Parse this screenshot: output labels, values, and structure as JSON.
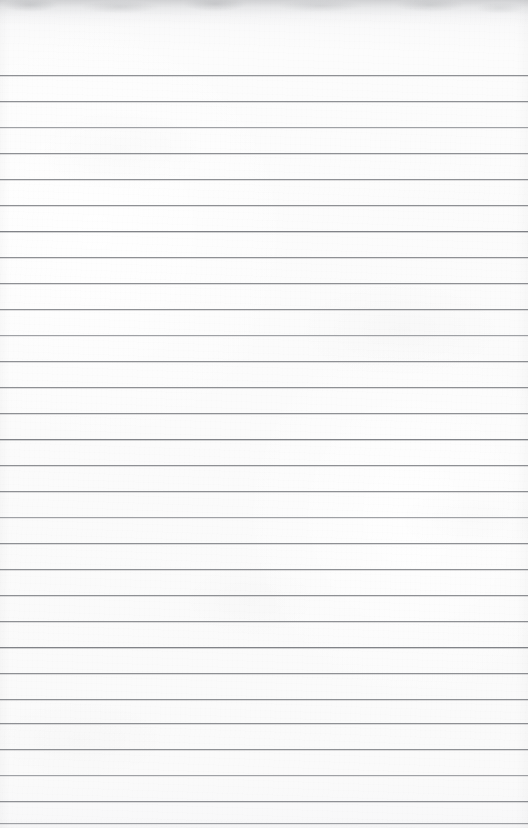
{
  "document": {
    "kind": "scanned-lined-notebook-page",
    "title": "Blank lined notebook page",
    "content_text": "",
    "is_blank": true,
    "page_width_px": 528,
    "page_height_px": 828
  },
  "paper": {
    "background_color": "#fbfbfb",
    "texture": "subtle scan grain",
    "top_edge_smudge_color": "#96989c"
  },
  "ruling": {
    "line_color": "#8e9094",
    "line_color_faint": "#9fa1a5",
    "line_color_strong": "#818388",
    "line_thickness_px": 1,
    "line_spacing_px": 26,
    "first_line_y_px": 75,
    "line_count": 29,
    "left_margin_px": 0,
    "right_margin_px": 0,
    "has_vertical_margin_rule": false,
    "lines": [
      {
        "index": 1,
        "y": 75,
        "weight": "normal"
      },
      {
        "index": 2,
        "y": 101,
        "weight": "normal"
      },
      {
        "index": 3,
        "y": 127,
        "weight": "faint"
      },
      {
        "index": 4,
        "y": 153,
        "weight": "normal"
      },
      {
        "index": 5,
        "y": 179,
        "weight": "normal"
      },
      {
        "index": 6,
        "y": 205,
        "weight": "normal"
      },
      {
        "index": 7,
        "y": 231,
        "weight": "strong"
      },
      {
        "index": 8,
        "y": 257,
        "weight": "normal"
      },
      {
        "index": 9,
        "y": 283,
        "weight": "normal"
      },
      {
        "index": 10,
        "y": 309,
        "weight": "normal"
      },
      {
        "index": 11,
        "y": 335,
        "weight": "faint"
      },
      {
        "index": 12,
        "y": 361,
        "weight": "normal"
      },
      {
        "index": 13,
        "y": 387,
        "weight": "normal"
      },
      {
        "index": 14,
        "y": 413,
        "weight": "normal"
      },
      {
        "index": 15,
        "y": 439,
        "weight": "strong"
      },
      {
        "index": 16,
        "y": 465,
        "weight": "normal"
      },
      {
        "index": 17,
        "y": 491,
        "weight": "normal"
      },
      {
        "index": 18,
        "y": 517,
        "weight": "faint"
      },
      {
        "index": 19,
        "y": 543,
        "weight": "normal"
      },
      {
        "index": 20,
        "y": 569,
        "weight": "normal"
      },
      {
        "index": 21,
        "y": 595,
        "weight": "normal"
      },
      {
        "index": 22,
        "y": 621,
        "weight": "normal"
      },
      {
        "index": 23,
        "y": 647,
        "weight": "strong"
      },
      {
        "index": 24,
        "y": 673,
        "weight": "normal"
      },
      {
        "index": 25,
        "y": 699,
        "weight": "normal"
      },
      {
        "index": 26,
        "y": 723,
        "weight": "normal"
      },
      {
        "index": 27,
        "y": 749,
        "weight": "normal"
      },
      {
        "index": 28,
        "y": 775,
        "weight": "faint"
      },
      {
        "index": 29,
        "y": 801,
        "weight": "normal"
      },
      {
        "index": 30,
        "y": 823,
        "weight": "faint"
      }
    ]
  }
}
